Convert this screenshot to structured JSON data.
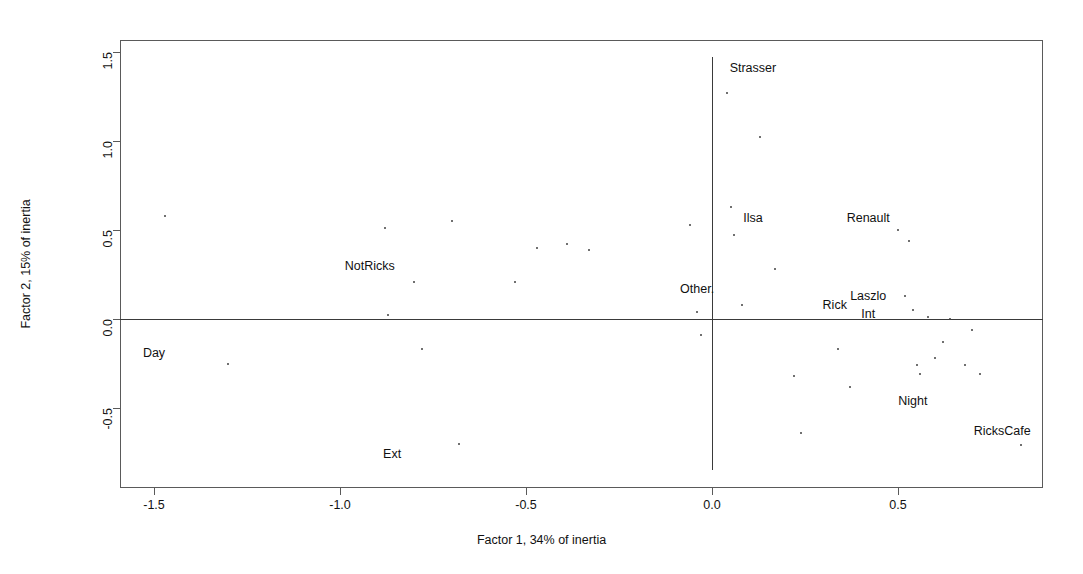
{
  "chart_data": {
    "type": "scatter",
    "title": "",
    "xlabel": "Factor 1, 34% of inertia",
    "ylabel": "Factor 2, 15% of inertia",
    "xlim": [
      -1.59,
      0.89
    ],
    "ylim": [
      -0.84,
      1.51
    ],
    "xticks": [
      -1.5,
      -1.0,
      -0.5,
      0.0,
      0.5
    ],
    "xticklabels": [
      "-1.5",
      "-1.0",
      "-0.5",
      "0.0",
      "0.5"
    ],
    "yticks": [
      -0.5,
      0.0,
      0.5,
      1.0,
      1.5
    ],
    "yticklabels": [
      "-0.5",
      "0.0",
      "0.5",
      "1.0",
      "1.5"
    ],
    "grid": false,
    "legend": null,
    "reference_lines": [
      {
        "name": "horizontal-zero",
        "axis": "h",
        "value": 0.0
      },
      {
        "name": "vertical-zero",
        "axis": "v",
        "value": 0.0
      }
    ],
    "annotations": [
      {
        "label": "Strasser",
        "x": 0.11,
        "y": 1.41,
        "anchor": "center"
      },
      {
        "label": "Ilsa",
        "x": 0.11,
        "y": 0.57,
        "anchor": "center"
      },
      {
        "label": "Renault",
        "x": 0.42,
        "y": 0.57,
        "anchor": "center"
      },
      {
        "label": "NotRicks",
        "x": -0.92,
        "y": 0.3,
        "anchor": "center"
      },
      {
        "label": "Other.",
        "x": -0.04,
        "y": 0.17,
        "anchor": "center"
      },
      {
        "label": "Rick",
        "x": 0.33,
        "y": 0.08,
        "anchor": "center"
      },
      {
        "label": "Laszlo",
        "x": 0.42,
        "y": 0.13,
        "anchor": "center"
      },
      {
        "label": "Int",
        "x": 0.42,
        "y": 0.03,
        "anchor": "center"
      },
      {
        "label": "Day",
        "x": -1.5,
        "y": -0.19,
        "anchor": "center"
      },
      {
        "label": "Night",
        "x": 0.54,
        "y": -0.46,
        "anchor": "center"
      },
      {
        "label": "RicksCafe",
        "x": 0.78,
        "y": -0.63,
        "anchor": "center"
      },
      {
        "label": "Ext",
        "x": -0.86,
        "y": -0.76,
        "anchor": "center"
      }
    ],
    "points": [
      {
        "x": -1.47,
        "y": 0.58
      },
      {
        "x": -1.3,
        "y": -0.25
      },
      {
        "x": -0.88,
        "y": 0.51
      },
      {
        "x": -0.87,
        "y": 0.02
      },
      {
        "x": -0.8,
        "y": 0.21
      },
      {
        "x": -0.78,
        "y": -0.17
      },
      {
        "x": -0.7,
        "y": 0.55
      },
      {
        "x": -0.68,
        "y": -0.7
      },
      {
        "x": -0.53,
        "y": 0.21
      },
      {
        "x": -0.47,
        "y": 0.4
      },
      {
        "x": -0.39,
        "y": 0.42
      },
      {
        "x": -0.33,
        "y": 0.39
      },
      {
        "x": -0.06,
        "y": 0.53
      },
      {
        "x": -0.04,
        "y": 0.04
      },
      {
        "x": -0.03,
        "y": -0.09
      },
      {
        "x": 0.04,
        "y": 1.27
      },
      {
        "x": 0.05,
        "y": 0.63
      },
      {
        "x": 0.06,
        "y": 0.47
      },
      {
        "x": 0.08,
        "y": 0.08
      },
      {
        "x": 0.13,
        "y": 1.02
      },
      {
        "x": 0.17,
        "y": 0.28
      },
      {
        "x": 0.22,
        "y": -0.32
      },
      {
        "x": 0.24,
        "y": -0.64
      },
      {
        "x": 0.34,
        "y": -0.17
      },
      {
        "x": 0.37,
        "y": -0.38
      },
      {
        "x": 0.5,
        "y": 0.5
      },
      {
        "x": 0.52,
        "y": 0.13
      },
      {
        "x": 0.53,
        "y": 0.44
      },
      {
        "x": 0.54,
        "y": 0.05
      },
      {
        "x": 0.55,
        "y": -0.26
      },
      {
        "x": 0.56,
        "y": -0.31
      },
      {
        "x": 0.58,
        "y": 0.01
      },
      {
        "x": 0.6,
        "y": -0.22
      },
      {
        "x": 0.62,
        "y": -0.13
      },
      {
        "x": 0.64,
        "y": 0.0
      },
      {
        "x": 0.68,
        "y": -0.26
      },
      {
        "x": 0.7,
        "y": -0.06
      },
      {
        "x": 0.72,
        "y": -0.31
      },
      {
        "x": 0.83,
        "y": -0.71
      }
    ]
  }
}
